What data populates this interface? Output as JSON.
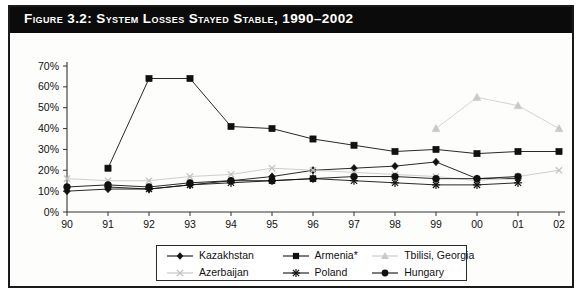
{
  "figure": {
    "title": "Figure 3.2:  System Losses Stayed Stable, 1990–2002",
    "title_label": "Figure 3.2:",
    "title_rest": "System Losses Stayed Stable, 1990–2002"
  },
  "legend": {
    "position": "bottom",
    "items": [
      {
        "label": "Kazakhstan",
        "marker": "diamond",
        "color": "#111111",
        "icon": "diamond-marker-icon"
      },
      {
        "label": "Armenia*",
        "marker": "square",
        "color": "#111111",
        "icon": "square-marker-icon"
      },
      {
        "label": "Tbilisi, Georgia",
        "marker": "triangle",
        "color": "#c9c9c9",
        "icon": "triangle-marker-icon"
      },
      {
        "label": "Azerbaijan",
        "marker": "x",
        "color": "#c2c2c2",
        "icon": "x-marker-icon"
      },
      {
        "label": "Poland",
        "marker": "star",
        "color": "#111111",
        "icon": "star-marker-icon"
      },
      {
        "label": "Hungary",
        "marker": "circle",
        "color": "#111111",
        "icon": "circle-marker-icon"
      }
    ]
  },
  "axes": {
    "y_ticks": [
      "0%",
      "10%",
      "20%",
      "30%",
      "40%",
      "50%",
      "60%",
      "70%"
    ],
    "x_ticks": [
      "90",
      "91",
      "92",
      "93",
      "94",
      "95",
      "96",
      "97",
      "98",
      "99",
      "00",
      "01",
      "02"
    ]
  },
  "chart_data": {
    "type": "line",
    "title": "System Losses Stayed Stable, 1990–2002",
    "xlabel": "",
    "ylabel": "",
    "ylim": [
      0,
      70
    ],
    "ytick_step": 10,
    "grid": false,
    "legend_position": "bottom",
    "categories": [
      "90",
      "91",
      "92",
      "93",
      "94",
      "95",
      "96",
      "97",
      "98",
      "99",
      "00",
      "01",
      "02"
    ],
    "series": [
      {
        "name": "Kazakhstan",
        "marker": "diamond",
        "color": "#111111",
        "values": [
          10,
          11,
          11,
          13,
          15,
          17,
          20,
          21,
          22,
          24,
          16,
          16,
          null
        ]
      },
      {
        "name": "Armenia*",
        "marker": "square",
        "color": "#111111",
        "values": [
          null,
          21,
          64,
          64,
          41,
          40,
          35,
          32,
          29,
          30,
          28,
          29,
          29
        ]
      },
      {
        "name": "Tbilisi, Georgia",
        "marker": "triangle",
        "color": "#c9c9c9",
        "values": [
          null,
          null,
          null,
          null,
          null,
          null,
          null,
          null,
          null,
          40,
          55,
          51,
          40
        ]
      },
      {
        "name": "Azerbaijan",
        "marker": "x",
        "color": "#c2c2c2",
        "values": [
          16,
          15,
          15,
          17,
          18,
          21,
          20,
          19,
          18,
          17,
          15,
          17,
          20
        ]
      },
      {
        "name": "Poland",
        "marker": "star",
        "color": "#111111",
        "values": [
          null,
          12,
          11,
          13,
          14,
          15,
          16,
          15,
          14,
          13,
          13,
          14,
          null
        ]
      },
      {
        "name": "Hungary",
        "marker": "circle",
        "color": "#111111",
        "values": [
          12,
          13,
          12,
          14,
          15,
          15,
          16,
          17,
          17,
          16,
          16,
          17,
          null
        ]
      }
    ]
  }
}
